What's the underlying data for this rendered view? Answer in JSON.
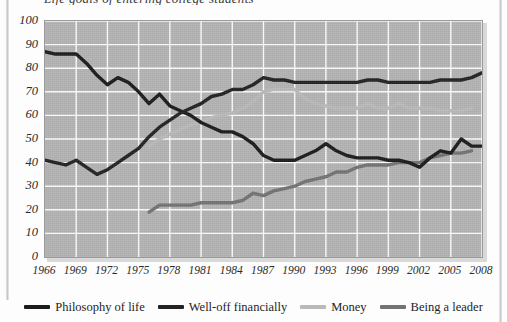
{
  "page": {
    "title_clipped": "Life goals of entering college students"
  },
  "chart_data": {
    "type": "line",
    "title": "Life goals of entering college students",
    "xlabel": "",
    "ylabel": "",
    "xlim": [
      1966,
      2008
    ],
    "ylim": [
      0,
      100
    ],
    "grid": true,
    "legend_position": "bottom",
    "plot_background": "#b3b3b3",
    "gridline_color": "#ffffff",
    "x_ticks": [
      1966,
      1969,
      1972,
      1975,
      1978,
      1981,
      1984,
      1987,
      1990,
      1993,
      1996,
      1999,
      2002,
      2005,
      2008
    ],
    "y_ticks": [
      0,
      10,
      20,
      30,
      40,
      50,
      60,
      70,
      80,
      90,
      100
    ],
    "series": [
      {
        "name": "Philosophy of life",
        "color": "#1c1c1c",
        "x": [
          1966,
          1967,
          1968,
          1969,
          1970,
          1971,
          1972,
          1973,
          1974,
          1975,
          1976,
          1977,
          1978,
          1979,
          1980,
          1981,
          1982,
          1983,
          1984,
          1985,
          1986,
          1987,
          1988,
          1989,
          1990,
          1991,
          1992,
          1993,
          1994,
          1995,
          1996,
          1997,
          1998,
          1999,
          2000,
          2001,
          2002,
          2003,
          2004,
          2005,
          2006,
          2007,
          2008
        ],
        "values": [
          87,
          86,
          86,
          86,
          82,
          77,
          73,
          76,
          74,
          70,
          65,
          69,
          64,
          62,
          60,
          57,
          55,
          53,
          53,
          51,
          48,
          43,
          41,
          41,
          41,
          43,
          45,
          48,
          45,
          43,
          42,
          42,
          42,
          41,
          41,
          40,
          38,
          42,
          45,
          44,
          50,
          47,
          47
        ]
      },
      {
        "name": "Well-off financially",
        "color": "#232323",
        "x": [
          1966,
          1967,
          1968,
          1969,
          1970,
          1971,
          1972,
          1973,
          1974,
          1975,
          1976,
          1977,
          1978,
          1979,
          1980,
          1981,
          1982,
          1983,
          1984,
          1985,
          1986,
          1987,
          1988,
          1989,
          1990,
          1991,
          1992,
          1993,
          1994,
          1995,
          1996,
          1997,
          1998,
          1999,
          2000,
          2001,
          2002,
          2003,
          2004,
          2005,
          2006,
          2007,
          2008
        ],
        "values": [
          41,
          40,
          39,
          41,
          38,
          35,
          37,
          40,
          43,
          46,
          51,
          55,
          58,
          61,
          63,
          65,
          68,
          69,
          71,
          71,
          73,
          76,
          75,
          75,
          74,
          74,
          74,
          74,
          74,
          74,
          74,
          75,
          75,
          74,
          74,
          74,
          74,
          74,
          75,
          75,
          75,
          76,
          78
        ]
      },
      {
        "name": "Money",
        "color": "#b9b9b9",
        "x": [
          1976,
          1977,
          1978,
          1979,
          1980,
          1981,
          1982,
          1983,
          1984,
          1985,
          1986,
          1987,
          1988,
          1989,
          1990,
          1991,
          1992,
          1993,
          1994,
          1995,
          1996,
          1997,
          1998,
          1999,
          2000,
          2001,
          2002,
          2003,
          2004,
          2005,
          2006,
          2007
        ],
        "values": [
          47,
          50,
          52,
          54,
          56,
          57,
          59,
          60,
          61,
          63,
          66,
          70,
          71,
          71,
          71,
          67,
          65,
          64,
          63,
          63,
          63,
          65,
          63,
          63,
          65,
          63,
          63,
          63,
          62,
          62,
          62,
          63
        ]
      },
      {
        "name": "Being a leader",
        "color": "#737373",
        "x": [
          1976,
          1977,
          1978,
          1979,
          1980,
          1981,
          1982,
          1983,
          1984,
          1985,
          1986,
          1987,
          1988,
          1989,
          1990,
          1991,
          1992,
          1993,
          1994,
          1995,
          1996,
          1997,
          1998,
          1999,
          2000,
          2001,
          2002,
          2003,
          2004,
          2005,
          2006,
          2007
        ],
        "values": [
          19,
          22,
          22,
          22,
          22,
          23,
          23,
          23,
          23,
          24,
          27,
          26,
          28,
          29,
          30,
          32,
          33,
          34,
          36,
          36,
          38,
          39,
          39,
          39,
          40,
          40,
          40,
          42,
          43,
          44,
          44,
          45
        ]
      }
    ]
  },
  "legend": {
    "items": [
      {
        "label": "Philosophy of life",
        "color": "#1c1c1c"
      },
      {
        "label": "Well-off financially",
        "color": "#232323"
      },
      {
        "label": "Money",
        "color": "#b9b9b9"
      },
      {
        "label": "Being a leader",
        "color": "#737373"
      }
    ]
  }
}
